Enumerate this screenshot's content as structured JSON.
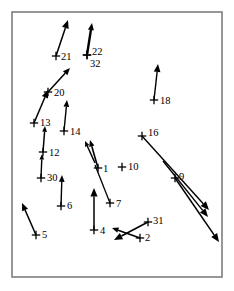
{
  "figure": {
    "title": "",
    "background_color": "#ffffff",
    "frame_color": "#7d7d7d",
    "marker_color": "#000000",
    "vector_color": "#000000",
    "frame": {
      "x": 12,
      "y": 12,
      "width": 210,
      "height": 265
    }
  },
  "chart_data": {
    "type": "scatter",
    "title": "",
    "subtitle": "",
    "xlabel": "",
    "ylabel": "",
    "xlim": [
      12,
      222
    ],
    "ylim": [
      12,
      277
    ],
    "grid": false,
    "legend": null,
    "marker_style": "plus-cross",
    "annotation_note": "Numbered cross markers with attached direction vectors (arrows). Coordinates are in screenshot pixel space, y increasing downward.",
    "points": [
      {
        "label": "21",
        "x": 56,
        "y": 56,
        "label_dx": 5,
        "label_dy": 2,
        "vector": {
          "dx": 12,
          "dy": -36,
          "has_arrowhead": true,
          "width": 1.5
        }
      },
      {
        "label": "22",
        "x": 87,
        "y": 55,
        "label_dx": 5,
        "label_dy": -2,
        "vector": {
          "dx": 5,
          "dy": -32,
          "has_arrowhead": true,
          "width": 2.4
        }
      },
      {
        "label": "32",
        "x": 87,
        "y": 55,
        "label_dx": 3,
        "label_dy": 10,
        "vector": null
      },
      {
        "label": "20",
        "x": 48,
        "y": 92,
        "label_dx": 6,
        "label_dy": 2,
        "vector": {
          "dx": 22,
          "dy": -24,
          "has_arrowhead": true,
          "width": 1.5
        }
      },
      {
        "label": "18",
        "x": 154,
        "y": 100,
        "label_dx": 6,
        "label_dy": 2,
        "vector": {
          "dx": 4,
          "dy": -36,
          "has_arrowhead": true,
          "width": 1.4
        }
      },
      {
        "label": "13",
        "x": 34,
        "y": 123,
        "label_dx": 6,
        "label_dy": 1,
        "vector": {
          "dx": 14,
          "dy": -33,
          "has_arrowhead": true,
          "width": 1.5
        }
      },
      {
        "label": "14",
        "x": 64,
        "y": 131,
        "label_dx": 6,
        "label_dy": 2,
        "vector": {
          "dx": 3,
          "dy": -31,
          "has_arrowhead": true,
          "width": 1.4
        }
      },
      {
        "label": "16",
        "x": 142,
        "y": 136,
        "label_dx": 6,
        "label_dy": -2,
        "vector": {
          "dx": 67,
          "dy": 74,
          "has_arrowhead": true,
          "width": 1.4
        }
      },
      {
        "label": "12",
        "x": 43,
        "y": 152,
        "label_dx": 6,
        "label_dy": 2,
        "vector": {
          "dx": 2,
          "dy": -26,
          "has_arrowhead": true,
          "width": 1.5
        }
      },
      {
        "label": "10",
        "x": 122,
        "y": 167,
        "label_dx": 6,
        "label_dy": 1,
        "vector": null
      },
      {
        "label": "1",
        "x": 98,
        "y": 168,
        "label_dx": 5,
        "label_dy": 2,
        "vector": {
          "dx": -8,
          "dy": -28,
          "has_arrowhead": true,
          "width": 1.6
        }
      },
      {
        "label": "30",
        "x": 41,
        "y": 178,
        "label_dx": 6,
        "label_dy": 1,
        "vector": {
          "dx": 1,
          "dy": -24,
          "has_arrowhead": true,
          "width": 1.4
        }
      },
      {
        "label": "9",
        "x": 175,
        "y": 178,
        "label_dx": 4,
        "label_dy": 0,
        "vector": {
          "dx": 44,
          "dy": 64,
          "has_arrowhead": true,
          "width": 1.4
        }
      },
      {
        "label": "6",
        "x": 61,
        "y": 206,
        "label_dx": 6,
        "label_dy": 1,
        "vector": {
          "dx": 1,
          "dy": -31,
          "has_arrowhead": true,
          "width": 1.4
        }
      },
      {
        "label": "7",
        "x": 110,
        "y": 203,
        "label_dx": 6,
        "label_dy": 2,
        "vector": {
          "dx": -15,
          "dy": -38,
          "has_arrowhead": false,
          "width": 1.3
        }
      },
      {
        "label": "4",
        "x": 94,
        "y": 230,
        "label_dx": 6,
        "label_dy": 2,
        "vector": {
          "dx": 0,
          "dy": -42,
          "has_arrowhead": true,
          "width": 1.5
        }
      },
      {
        "label": "5",
        "x": 36,
        "y": 235,
        "label_dx": 6,
        "label_dy": 1,
        "vector": {
          "dx": -14,
          "dy": -32,
          "has_arrowhead": true,
          "width": 1.5
        }
      },
      {
        "label": "31",
        "x": 148,
        "y": 222,
        "label_dx": 5,
        "label_dy": 0,
        "vector": {
          "dx": -34,
          "dy": 18,
          "has_arrowhead": true,
          "width": 1.6
        }
      },
      {
        "label": "2",
        "x": 140,
        "y": 238,
        "label_dx": 5,
        "label_dy": 1,
        "vector": {
          "dx": -28,
          "dy": -10,
          "has_arrowhead": true,
          "width": 1.6
        }
      }
    ],
    "extra_vectors": [
      {
        "name": "vector-16-secondary",
        "x": 163,
        "y": 161,
        "dx": 45,
        "dy": 56,
        "has_arrowhead": true,
        "width": 1.4
      },
      {
        "name": "vector-1-secondary",
        "x": 95,
        "y": 163,
        "dx": -10,
        "dy": -22,
        "has_arrowhead": true,
        "width": 1.5
      }
    ]
  }
}
